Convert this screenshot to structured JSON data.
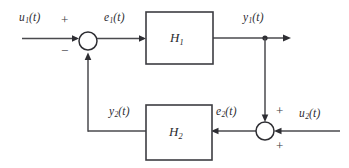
{
  "diagram": {
    "type": "control-system-block-diagram",
    "canvas": {
      "width": 349,
      "height": 168
    },
    "colors": {
      "background": "#ffffff",
      "line": "#4a4a4e",
      "block_stroke": "#3d3d42",
      "text": "#2b2b30"
    },
    "blocks": [
      {
        "id": "H1",
        "label_base": "H",
        "label_sub": "1",
        "x": 146,
        "y": 12,
        "width": 67,
        "height": 52
      },
      {
        "id": "H2",
        "label_base": "H",
        "label_sub": "2",
        "x": 146,
        "y": 105,
        "width": 66,
        "height": 55
      }
    ],
    "summing_junctions": [
      {
        "id": "sum-left",
        "cx": 88,
        "cy": 41,
        "r": 9
      },
      {
        "id": "sum-right",
        "cx": 265,
        "cy": 131,
        "r": 9
      }
    ],
    "node_dots": [
      {
        "id": "y1-branch-node",
        "cx": 265,
        "cy": 38,
        "r": 2.6
      }
    ],
    "signals": [
      {
        "id": "u1",
        "base": "u",
        "sub": "1",
        "arg": "(t)"
      },
      {
        "id": "e1",
        "base": "e",
        "sub": "1",
        "arg": "(t)"
      },
      {
        "id": "y1",
        "base": "y",
        "sub": "1",
        "arg": "(t)"
      },
      {
        "id": "y2",
        "base": "y",
        "sub": "2",
        "arg": "(t)"
      },
      {
        "id": "e2",
        "base": "e",
        "sub": "2",
        "arg": "(t)"
      },
      {
        "id": "u2",
        "base": "u",
        "sub": "2",
        "arg": "(t)"
      }
    ],
    "signs": [
      {
        "id": "sign-u1-plus",
        "text": "+",
        "at": "sum-left-top-input"
      },
      {
        "id": "sign-y2-minus",
        "text": "−",
        "at": "sum-left-bottom-input"
      },
      {
        "id": "sign-y1-plus",
        "text": "+",
        "at": "sum-right-top-input"
      },
      {
        "id": "sign-u2-plus",
        "text": "+",
        "at": "sum-right-bottom-input"
      }
    ]
  },
  "labels": {
    "u1": {
      "base": "u",
      "sub": "1",
      "arg": "(t)"
    },
    "e1": {
      "base": "e",
      "sub": "1",
      "arg": "(t)"
    },
    "y1": {
      "base": "y",
      "sub": "1",
      "arg": "(t)"
    },
    "y2": {
      "base": "y",
      "sub": "2",
      "arg": "(t)"
    },
    "e2": {
      "base": "e",
      "sub": "2",
      "arg": "(t)"
    },
    "u2": {
      "base": "u",
      "sub": "2",
      "arg": "(t)"
    },
    "H1": {
      "base": "H",
      "sub": "1"
    },
    "H2": {
      "base": "H",
      "sub": "2"
    },
    "plus_u1": "+",
    "minus_y2": "−",
    "plus_y1": "+",
    "plus_u2": "+"
  }
}
